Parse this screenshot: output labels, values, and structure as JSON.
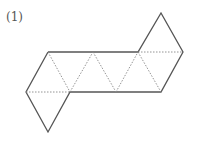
{
  "problem": {
    "label": "(1)",
    "figure": "octahedron-net",
    "description": "Net of a regular octahedron: 8 equilateral triangles — a strip of 6 triangles with one triangle attached at bottom-left and one at top-right",
    "face_count": 8,
    "line_color": "#555555",
    "fold_line_color": "#888888",
    "fold_line_style": "dashed"
  }
}
